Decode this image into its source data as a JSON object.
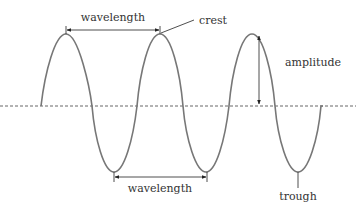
{
  "diagram": {
    "type": "transverse-wave",
    "labels": {
      "wavelength_top": "wavelength",
      "wavelength_bottom": "wavelength",
      "crest": "crest",
      "amplitude": "amplitude",
      "trough": "trough"
    },
    "colors": {
      "wave": "#777777",
      "axis": "#666666",
      "arrow": "#222222",
      "text": "#333333"
    }
  }
}
